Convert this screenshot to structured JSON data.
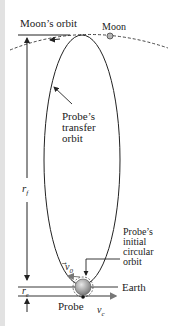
{
  "diagram": {
    "labels": {
      "moons_orbit": "Moon’s orbit",
      "moon": "Moon",
      "transfer_orbit": [
        "Probe’s",
        "transfer",
        "orbit"
      ],
      "r_f": "r",
      "r_f_sub": "f",
      "r_e": "r",
      "r_e_sub": "e",
      "initial_orbit": [
        "Probe’s",
        "initial",
        "circular",
        "orbit"
      ],
      "v0": "v",
      "v0_sub": "0",
      "earth": "Earth",
      "probe": "Probe",
      "vc": "v",
      "vc_sub": "c"
    },
    "colors": {
      "line": "#222222",
      "earth_fill": "#9a9a9a",
      "moon_fill": "#b5b5b5",
      "arrow_gray": "#777777"
    }
  }
}
